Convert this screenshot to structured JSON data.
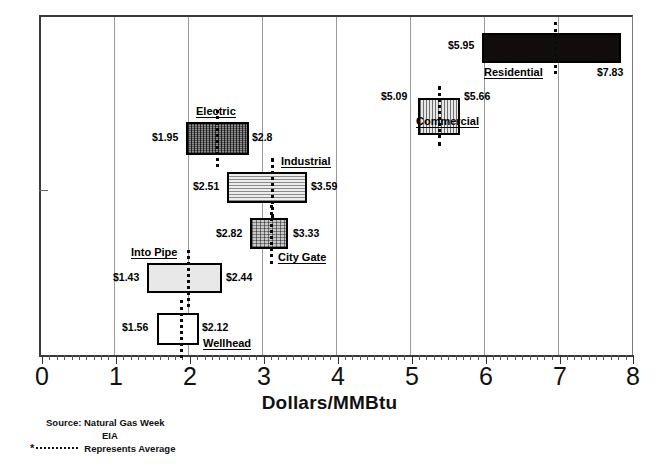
{
  "chart_data": {
    "type": "bar",
    "orientation": "horizontal",
    "title": "",
    "xlabel": "Dollars/MMBtu",
    "ylabel": "",
    "xlim": [
      0,
      8
    ],
    "xticks": [
      "0",
      "1",
      "2",
      "3",
      "4",
      "5",
      "6",
      "7",
      "8"
    ],
    "grid": "vertical gridlines at 1 through 7",
    "legend": "none",
    "note": "Floating range bars (low-high) per market segment with dotted average marker",
    "categories": [
      "Residential",
      "Commercial",
      "Electric",
      "Industrial",
      "City Gate",
      "Into Pipe",
      "Wellhead"
    ],
    "series": [
      {
        "name": "low",
        "values": [
          5.95,
          5.09,
          1.95,
          2.51,
          2.82,
          1.43,
          1.56
        ]
      },
      {
        "name": "high",
        "values": [
          7.83,
          5.66,
          2.8,
          3.59,
          3.33,
          2.44,
          2.12
        ]
      },
      {
        "name": "average",
        "values": [
          6.93,
          5.4,
          2.35,
          3.1,
          3.09,
          1.9,
          1.86
        ]
      }
    ],
    "bars": [
      {
        "name": "Residential",
        "low": 5.95,
        "high": 7.83,
        "avg": 6.93,
        "low_label": "$5.95",
        "high_label": "$7.83",
        "fill": "solid-black",
        "top": 33,
        "height": 30,
        "name_pos": "below-left",
        "low_label_pos": "left",
        "high_label_pos": "below-right"
      },
      {
        "name": "Commercial",
        "low": 5.09,
        "high": 5.66,
        "avg": 5.4,
        "low_label": "$5.09",
        "high_label": "$5.66",
        "fill": "vertical-lines",
        "top": 98,
        "height": 37,
        "name_pos": "below",
        "low_label_pos": "left",
        "high_label_pos": "right"
      },
      {
        "name": "Electric",
        "low": 1.95,
        "high": 2.8,
        "avg": 2.35,
        "low_label": "$1.95",
        "high_label": "$2.8",
        "fill": "cross-hatch-dark",
        "top": 122,
        "height": 33,
        "name_pos": "above",
        "low_label_pos": "left",
        "high_label_pos": "right"
      },
      {
        "name": "Industrial",
        "low": 2.51,
        "high": 3.59,
        "avg": 3.1,
        "low_label": "$2.51",
        "high_label": "$3.59",
        "fill": "horizontal-lines",
        "top": 172,
        "height": 31,
        "name_pos": "above-right",
        "low_label_pos": "left",
        "high_label_pos": "right"
      },
      {
        "name": "City Gate",
        "low": 2.82,
        "high": 3.33,
        "avg": 3.09,
        "low_label": "$2.82",
        "high_label": "$3.33",
        "fill": "gray-checker",
        "top": 218,
        "height": 31,
        "name_pos": "below-right",
        "low_label_pos": "left",
        "high_label_pos": "right"
      },
      {
        "name": "Into Pipe",
        "low": 1.43,
        "high": 2.44,
        "avg": 1.9,
        "low_label": "$1.43",
        "high_label": "$2.44",
        "fill": "light-gray",
        "top": 263,
        "height": 30,
        "name_pos": "above",
        "low_label_pos": "left",
        "high_label_pos": "right"
      },
      {
        "name": "Wellhead",
        "low": 1.56,
        "high": 2.12,
        "avg": 1.86,
        "low_label": "$1.56",
        "high_label": "$2.12",
        "fill": "white",
        "top": 313,
        "height": 32,
        "name_pos": "below-right",
        "low_label_pos": "left",
        "high_label_pos": "right"
      }
    ]
  },
  "axis": {
    "x_title": "Dollars/MMBtu",
    "ticks": [
      "0",
      "1",
      "2",
      "3",
      "4",
      "5",
      "6",
      "7",
      "8"
    ]
  },
  "labels": {
    "residential_name": "Residential",
    "residential_low": "$5.95",
    "residential_high": "$7.83",
    "commercial_name": "Commercial",
    "commercial_low": "$5.09",
    "commercial_high": "$5.66",
    "electric_name": "Electric",
    "electric_low": "$1.95",
    "electric_high": "$2.8",
    "industrial_name": "Industrial",
    "industrial_low": "$2.51",
    "industrial_high": "$3.59",
    "citygate_name": "City Gate",
    "citygate_low": "$2.82",
    "citygate_high": "$3.33",
    "intopipe_name": "Into Pipe",
    "intopipe_low": "$1.43",
    "intopipe_high": "$2.44",
    "wellhead_name": "Wellhead",
    "wellhead_low": "$1.56",
    "wellhead_high": "$2.12"
  },
  "footer": {
    "source_line1": "Source: Natural Gas Week",
    "source_line2": "EIA",
    "legend_star": "*",
    "legend_text": "Represents Average"
  },
  "colors": {
    "ink": "#000000",
    "gridline": "#9a9a9a",
    "axis": "#3a3a3a",
    "solid_fill": "#120d0d",
    "light_fill": "#e8e8e8"
  }
}
